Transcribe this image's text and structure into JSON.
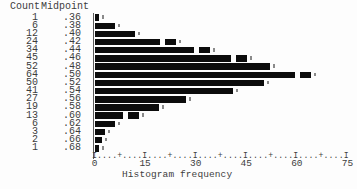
{
  "chart_data": {
    "type": "bar",
    "orientation": "horizontal",
    "title": "",
    "xlabel": "Histogram frequency",
    "ylabel": "",
    "xlim": [
      0,
      75
    ],
    "x_ticks": [
      0,
      15,
      30,
      45,
      60,
      75
    ],
    "grid": "off",
    "legend": "none",
    "bar_color": "#0c0c0c",
    "axis_line": "I....+....I....+....I....+....I....+....I....+....I",
    "columns": {
      "count": "Count",
      "midpoint": "Midpoint"
    },
    "categories": [
      ".36",
      ".38",
      ".40",
      ".42",
      ".44",
      ".46",
      ".48",
      ".50",
      ".52",
      ".54",
      ".56",
      ".58",
      ".60",
      ".62",
      ".64",
      ".66",
      ".68"
    ],
    "values": [
      1,
      6,
      12,
      24,
      34,
      45,
      52,
      64,
      50,
      41,
      27,
      19,
      13,
      6,
      3,
      2,
      1
    ],
    "rows": [
      {
        "count": 1,
        "midpoint": ".36"
      },
      {
        "count": 6,
        "midpoint": ".38"
      },
      {
        "count": 12,
        "midpoint": ".40"
      },
      {
        "count": 24,
        "midpoint": ".42"
      },
      {
        "count": 34,
        "midpoint": ".44"
      },
      {
        "count": 45,
        "midpoint": ".46"
      },
      {
        "count": 52,
        "midpoint": ".48"
      },
      {
        "count": 64,
        "midpoint": ".50"
      },
      {
        "count": 50,
        "midpoint": ".52"
      },
      {
        "count": 41,
        "midpoint": ".54"
      },
      {
        "count": 27,
        "midpoint": ".56"
      },
      {
        "count": 19,
        "midpoint": ".58"
      },
      {
        "count": 13,
        "midpoint": ".60"
      },
      {
        "count": 6,
        "midpoint": ".62"
      },
      {
        "count": 3,
        "midpoint": ".64"
      },
      {
        "count": 2,
        "midpoint": ".66"
      },
      {
        "count": 1,
        "midpoint": ".68"
      }
    ]
  }
}
